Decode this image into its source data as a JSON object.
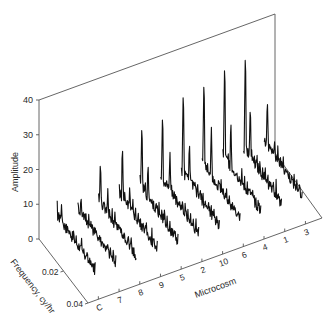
{
  "chart_data": {
    "type": "line",
    "subtype": "3d-waterfall",
    "title": "",
    "xlabel": "Frequency, cy/hr",
    "ylabel": "Amplitude",
    "zlabel": "Microcosm",
    "ylim": [
      0,
      40
    ],
    "yticks": [
      "0",
      "10",
      "20",
      "30",
      "40"
    ],
    "xlim": [
      0,
      0.04
    ],
    "xticks": [
      "0",
      "0.02",
      "0.04"
    ],
    "categories": [
      "C",
      "7",
      "8",
      "9",
      "5",
      "2",
      "10",
      "6",
      "4",
      "1",
      "3"
    ],
    "grid": false,
    "legend": "none",
    "series": [
      {
        "name": "C",
        "peak_amplitude": 11,
        "peaks": [
          {
            "f": 0.005,
            "a": 11
          },
          {
            "f": 0.012,
            "a": 6
          }
        ]
      },
      {
        "name": "7",
        "peak_amplitude": 11,
        "peaks": [
          {
            "f": 0.004,
            "a": 11
          },
          {
            "f": 0.012,
            "a": 7
          }
        ]
      },
      {
        "name": "8",
        "peak_amplitude": 19,
        "peaks": [
          {
            "f": 0.003,
            "a": 19
          },
          {
            "f": 0.009,
            "a": 13
          }
        ]
      },
      {
        "name": "9",
        "peak_amplitude": 22,
        "peaks": [
          {
            "f": 0.004,
            "a": 22
          },
          {
            "f": 0.01,
            "a": 12
          }
        ]
      },
      {
        "name": "5",
        "peak_amplitude": 26,
        "peaks": [
          {
            "f": 0.003,
            "a": 26
          },
          {
            "f": 0.008,
            "a": 16
          }
        ]
      },
      {
        "name": "2",
        "peak_amplitude": 27,
        "peaks": [
          {
            "f": 0.003,
            "a": 27
          },
          {
            "f": 0.009,
            "a": 17
          }
        ]
      },
      {
        "name": "10",
        "peak_amplitude": 32,
        "peaks": [
          {
            "f": 0.003,
            "a": 32
          },
          {
            "f": 0.008,
            "a": 18
          }
        ]
      },
      {
        "name": "6",
        "peak_amplitude": 33,
        "peaks": [
          {
            "f": 0.003,
            "a": 33
          },
          {
            "f": 0.009,
            "a": 20
          }
        ]
      },
      {
        "name": "4",
        "peak_amplitude": 36,
        "peaks": [
          {
            "f": 0.003,
            "a": 36
          },
          {
            "f": 0.008,
            "a": 20
          }
        ]
      },
      {
        "name": "1",
        "peak_amplitude": 37,
        "peaks": [
          {
            "f": 0.003,
            "a": 37
          },
          {
            "f": 0.007,
            "a": 22
          }
        ]
      },
      {
        "name": "3",
        "peak_amplitude": 20,
        "peaks": [
          {
            "f": 0.004,
            "a": 20
          },
          {
            "f": 0.01,
            "a": 10
          }
        ]
      }
    ],
    "annotations": []
  },
  "labels": {
    "amplitude_axis": "Amplitude",
    "frequency_axis": "Frequency, cy/hr",
    "microcosm_axis": "Microcosm"
  },
  "ticks": {
    "amplitude": [
      "0",
      "10",
      "20",
      "30",
      "40"
    ],
    "frequency": [
      "0.02",
      "0.04"
    ],
    "microcosm": [
      "C",
      "7",
      "8",
      "9",
      "5",
      "2",
      "10",
      "6",
      "4",
      "1",
      "3"
    ]
  }
}
